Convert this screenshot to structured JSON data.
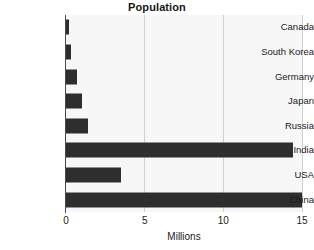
{
  "chart_data": {
    "type": "bar",
    "orientation": "horizontal",
    "title": "Population",
    "xlabel": "Millions",
    "ylabel": "",
    "xlim": [
      0,
      15
    ],
    "xticks": [
      0,
      5,
      10,
      15
    ],
    "xtick_labels": [
      "0",
      "5",
      "10",
      "15"
    ],
    "grid": true,
    "grid_axis": "x",
    "legend": false,
    "categories": [
      "Canada",
      "South Korea",
      "Germany",
      "Japan",
      "Russia",
      "India",
      "USA",
      "China"
    ],
    "values": [
      0.2,
      0.3,
      0.7,
      1.0,
      1.4,
      14.4,
      3.5,
      15.0
    ],
    "bar_color": "#2e2e2e",
    "plot_background": "#f7f7f7",
    "grid_color": "#cfcfcf",
    "axis_color": "#4a4a4a",
    "bars": [
      {
        "label": "Canada",
        "value": 0.2
      },
      {
        "label": "South Korea",
        "value": 0.3
      },
      {
        "label": "Germany",
        "value": 0.7
      },
      {
        "label": "Japan",
        "value": 1.0
      },
      {
        "label": "Russia",
        "value": 1.4
      },
      {
        "label": "India",
        "value": 14.4
      },
      {
        "label": "USA",
        "value": 3.5
      },
      {
        "label": "China",
        "value": 15.0
      }
    ]
  }
}
